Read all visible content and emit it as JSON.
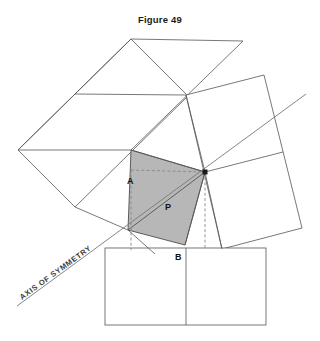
{
  "figure": {
    "title": "Figure 49",
    "type": "geometric-construction",
    "colors": {
      "shaded_fill": "#b3b3b3",
      "outline": "#4d4d4d",
      "dashed": "#808080",
      "text": "#111111",
      "background": "#ffffff"
    },
    "labels": {
      "vertex_a": "A",
      "vertex_b": "B",
      "point_p": "P",
      "axis": "AXIS OF SYMMETRY"
    },
    "geometry": {
      "shaded_quad": [
        [
          131,
          150
        ],
        [
          205,
          172
        ],
        [
          185,
          245
        ],
        [
          128,
          230
        ]
      ],
      "upper_left_square": [
        [
          131,
          39
        ],
        [
          18,
          150
        ],
        [
          131,
          150
        ],
        [
          243,
          41
        ]
      ],
      "upper_left_square_divider": [
        [
          75,
          94
        ],
        [
          186,
          95
        ]
      ],
      "right_square": [
        [
          186,
          95
        ],
        [
          264,
          75
        ],
        [
          302,
          228
        ],
        [
          222,
          249
        ]
      ],
      "right_square_divider": [
        [
          205,
          172
        ],
        [
          283,
          152
        ]
      ],
      "bottom_square": [
        [
          105,
          248
        ],
        [
          266,
          248
        ],
        [
          266,
          325
        ],
        [
          105,
          325
        ]
      ],
      "bottom_square_divider": [
        [
          186,
          248
        ],
        [
          186,
          325
        ]
      ],
      "axis_line": [
        [
          17,
          306
        ],
        [
          306,
          94
        ]
      ],
      "diagonal_p": [
        [
          128,
          230
        ],
        [
          205,
          172
        ]
      ],
      "dashed_horizontal": [
        [
          131,
          170
        ],
        [
          205,
          172
        ]
      ],
      "dashed_vertical_left": [
        [
          131,
          170
        ],
        [
          131,
          248
        ]
      ],
      "dashed_vertical_right": [
        [
          205,
          172
        ],
        [
          205,
          248
        ]
      ],
      "hub_point": [
        205,
        172
      ],
      "label_a_pos": [
        128,
        181
      ],
      "label_b_pos": [
        176,
        259
      ],
      "label_p_pos": [
        166,
        208
      ],
      "axis_text_pos": [
        22,
        300
      ],
      "axis_text_rotation": -36
    }
  }
}
